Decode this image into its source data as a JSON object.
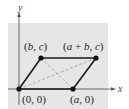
{
  "diagram": {
    "type": "parallelogram-coordinate-proof",
    "axes": {
      "x_label": "x",
      "y_label": "y"
    },
    "vertices": [
      {
        "id": "origin",
        "label": "(0, 0)",
        "px": [
          19,
          89
        ]
      },
      {
        "id": "a0",
        "label": "(a, 0)",
        "px": [
          73,
          89
        ]
      },
      {
        "id": "bc",
        "label": "(b, c)",
        "px": [
          41,
          58
        ]
      },
      {
        "id": "abc",
        "label": "(a + b, c)",
        "px": [
          96,
          58
        ]
      }
    ],
    "edges": [
      "origin-a0",
      "a0-abc",
      "abc-bc",
      "bc-origin"
    ],
    "diagonals": [
      "origin-abc",
      "bc-a0"
    ],
    "colors": {
      "background": "#e6e6e6",
      "edge": "#1a1a1a",
      "diagonal": "#9a9a9a",
      "axis": "#555555"
    }
  }
}
